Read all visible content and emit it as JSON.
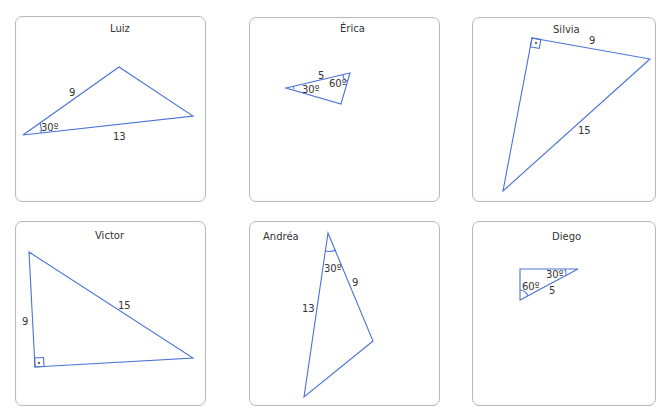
{
  "header": {
    "cut_text": ""
  },
  "colors": {
    "line": "#4a72d6",
    "border": "#b9b9b9",
    "text": "#333333"
  },
  "panels": [
    {
      "name": "Luiz",
      "labels": {
        "side_a": "9",
        "side_b": "13",
        "angle": "30º"
      }
    },
    {
      "name": "Érica",
      "labels": {
        "side_a": "5",
        "angle_a": "30º",
        "angle_b": "60º"
      }
    },
    {
      "name": "Silvia",
      "labels": {
        "side_a": "9",
        "side_b": "15",
        "right_angle": "·"
      }
    },
    {
      "name": "Victor",
      "labels": {
        "side_a": "9",
        "side_b": "15",
        "right_angle": "·"
      }
    },
    {
      "name": "Andréa",
      "labels": {
        "side_a": "13",
        "side_b": "9",
        "angle": "30º"
      }
    },
    {
      "name": "Diego",
      "labels": {
        "side_a": "5",
        "angle_a": "30º",
        "angle_b": "60º"
      }
    }
  ]
}
